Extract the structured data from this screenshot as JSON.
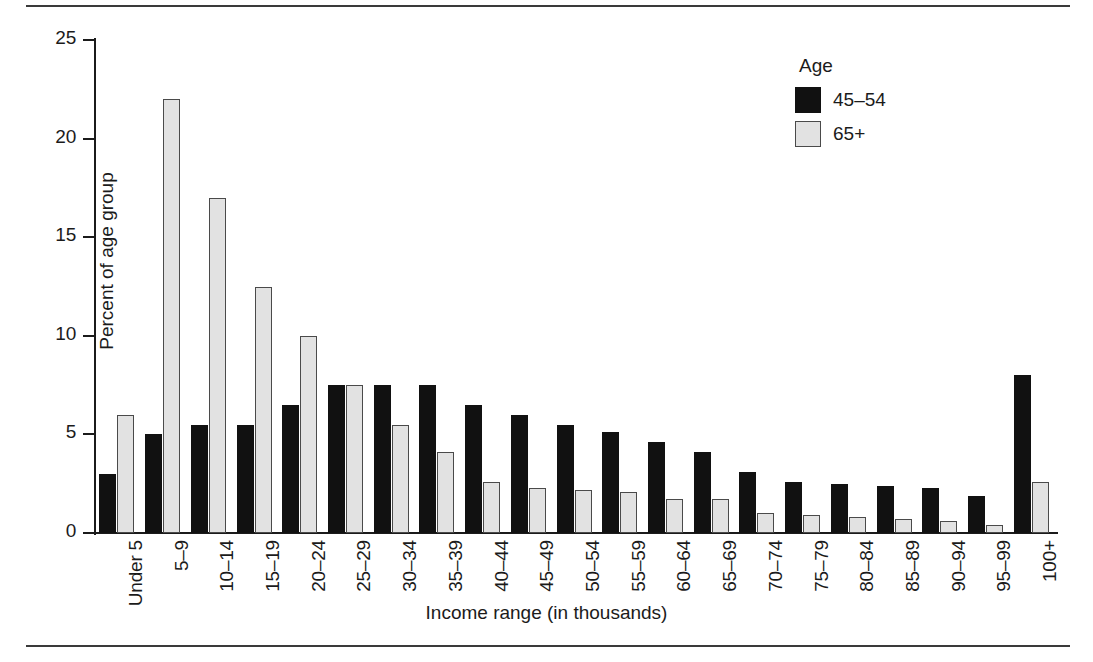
{
  "chart_data": {
    "type": "bar",
    "title": "",
    "xlabel": "Income range (in thousands)",
    "ylabel": "Percent of age group",
    "ylim": [
      0,
      25
    ],
    "yticks": [
      0,
      5,
      10,
      15,
      20,
      25
    ],
    "grid": false,
    "legend": {
      "title": "Age",
      "position": "top-right",
      "entries": [
        "45–54",
        "65+"
      ]
    },
    "categories": [
      "Under 5",
      "5–9",
      "10–14",
      "15–19",
      "20–24",
      "25–29",
      "30–34",
      "35–39",
      "40–44",
      "45–49",
      "50–54",
      "55–59",
      "60–64",
      "65–69",
      "70–74",
      "75–79",
      "80–84",
      "85–89",
      "90–94",
      "95–99",
      "100+"
    ],
    "series": [
      {
        "name": "45–54",
        "color": "#111111",
        "values": [
          3.0,
          5.0,
          5.5,
          5.5,
          6.5,
          7.5,
          7.5,
          7.5,
          6.5,
          6.0,
          5.5,
          5.1,
          4.6,
          4.1,
          3.1,
          2.6,
          2.5,
          2.4,
          2.3,
          1.9,
          8.0
        ]
      },
      {
        "name": "65+",
        "color": "#e2e2e2",
        "values": [
          6.0,
          22.0,
          17.0,
          12.5,
          10.0,
          7.5,
          5.5,
          4.1,
          2.6,
          2.3,
          2.2,
          2.1,
          1.7,
          1.7,
          1.0,
          0.9,
          0.8,
          0.7,
          0.6,
          0.4,
          2.6
        ]
      }
    ]
  }
}
